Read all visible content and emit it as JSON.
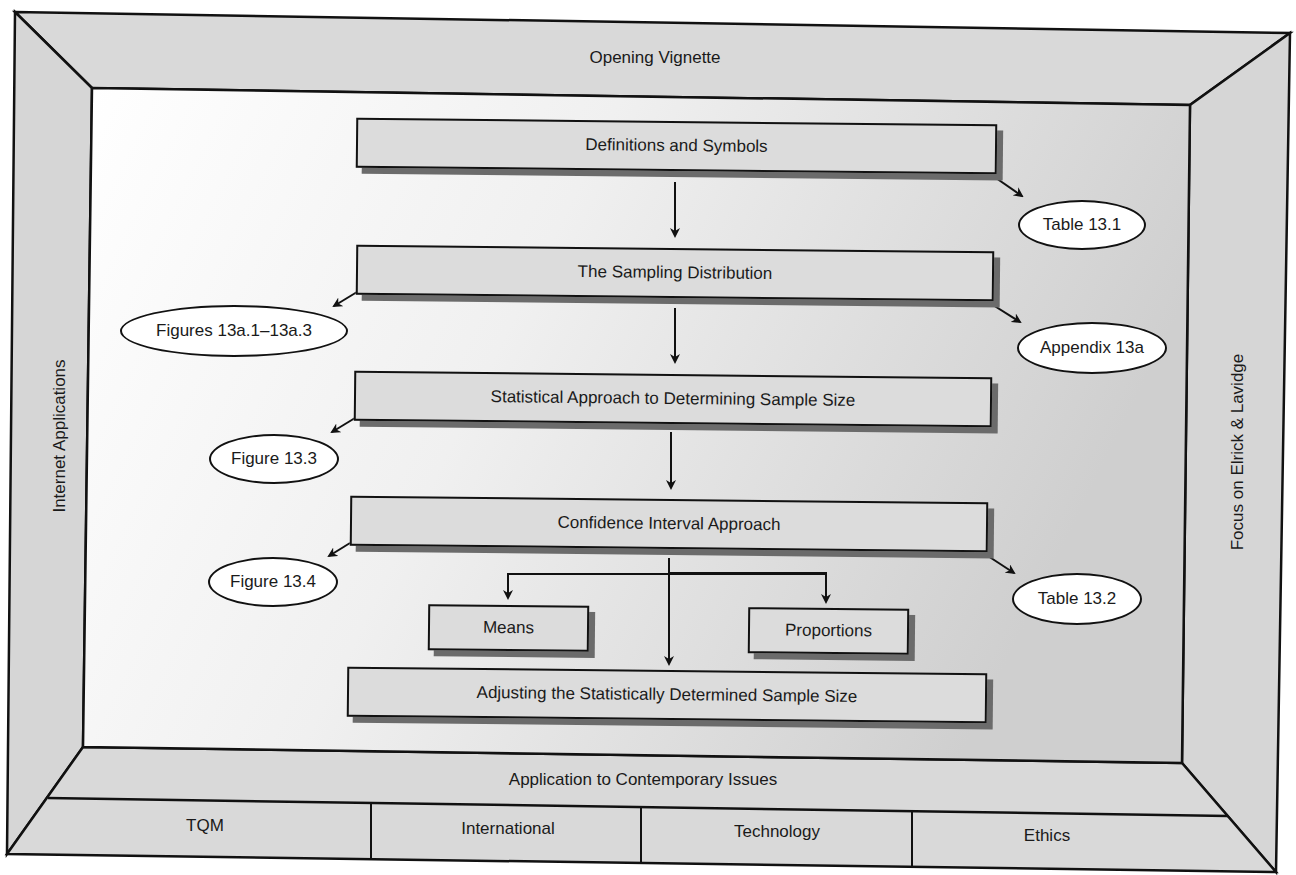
{
  "frame": {
    "top": "Opening Vignette",
    "left": "Internet Applications",
    "right": "Focus on Elrick & Lavidge",
    "bottom": "Application to Contemporary Issues",
    "bottom_cells": [
      "TQM",
      "International",
      "Technology",
      "Ethics"
    ]
  },
  "flow": {
    "steps": [
      "Definitions and Symbols",
      "The Sampling Distribution",
      "Statistical Approach to Determining Sample Size",
      "Confidence Interval Approach",
      "Adjusting the Statistically Determined Sample Size"
    ],
    "branches": [
      "Means",
      "Proportions"
    ]
  },
  "references": {
    "table_13_1": "Table 13.1",
    "figures_13a": "Figures 13a.1–13a.3",
    "appendix_13a": "Appendix 13a",
    "figure_13_3": "Figure 13.3",
    "figure_13_4": "Figure 13.4",
    "table_13_2": "Table 13.2"
  },
  "colors": {
    "frame_fill": "#d9d9d9",
    "box_fill": "#dcdcdc",
    "box_shadow": "#6b6b6b",
    "outline": "#111111",
    "oval_fill": "#ffffff"
  }
}
